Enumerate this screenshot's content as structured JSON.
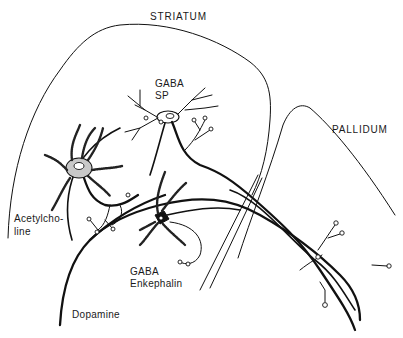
{
  "diagram": {
    "type": "neuroanatomy-schematic",
    "regions": [
      {
        "id": "striatum",
        "label": "STRIATUM"
      },
      {
        "id": "pallidum",
        "label": "PALLIDUM"
      }
    ],
    "neurons": [
      {
        "id": "gaba-sp",
        "label_line1": "GABA",
        "label_line2": "SP"
      },
      {
        "id": "acetylcholine",
        "label_line1": "Acetylcho-",
        "label_line2": "line"
      },
      {
        "id": "gaba-enkephalin",
        "label_line1": "GABA",
        "label_line2": "Enkephalin"
      },
      {
        "id": "dopamine",
        "label_line1": "Dopamine"
      }
    ],
    "colors": {
      "stroke": "#111111",
      "background": "#ffffff",
      "cholinergic_soma_fill": "#c8c8c8",
      "enkephalin_soma_fill": "#111111"
    }
  }
}
